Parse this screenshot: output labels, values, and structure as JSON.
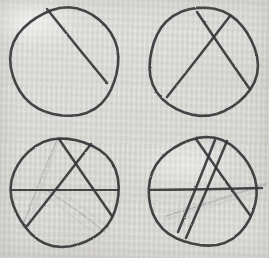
{
  "scene": {
    "title": "Hand-drawn pencil sketch: four circles with chords",
    "medium": "graphite pencil on textured paper",
    "layout": "2x2 grid of circles",
    "canvas": {
      "width": 269,
      "height": 258
    },
    "colors": {
      "paper": "#ececea",
      "paper_light": "#f3f2f0",
      "paper_shadow": "#e4e3df",
      "pencil_dark": "#37363a",
      "pencil_mid": "#55545a",
      "pencil_faint": "#9a9aa0",
      "pencil_ghost": "#b9b9bd"
    },
    "panels": [
      {
        "name": "top-left-circle",
        "index": 1,
        "circle": {
          "cx": 65,
          "cy": 62,
          "r": 54
        },
        "chord_count": 1,
        "faint_line_count": 0,
        "chords": [
          {
            "name": "chord-1",
            "x1": 47,
            "y1": 9,
            "x2": 107,
            "y2": 83,
            "weight": "dark"
          }
        ],
        "faint_lines": []
      },
      {
        "name": "top-right-circle",
        "index": 2,
        "circle": {
          "cx": 203,
          "cy": 62,
          "r": 54
        },
        "chord_count": 2,
        "faint_line_count": 0,
        "chords": [
          {
            "name": "chord-1",
            "x1": 197,
            "y1": 12,
            "x2": 249,
            "y2": 88,
            "weight": "dark"
          },
          {
            "name": "chord-2",
            "x1": 230,
            "y1": 16,
            "x2": 167,
            "y2": 97,
            "weight": "dark"
          }
        ],
        "faint_lines": []
      },
      {
        "name": "bottom-left-circle",
        "index": 3,
        "circle": {
          "cx": 65,
          "cy": 192,
          "r": 54
        },
        "chord_count": 3,
        "faint_line_count": 6,
        "chords": [
          {
            "name": "chord-1",
            "x1": 59,
            "y1": 139,
            "x2": 112,
            "y2": 216,
            "weight": "dark"
          },
          {
            "name": "chord-2",
            "x1": 91,
            "y1": 144,
            "x2": 27,
            "y2": 226,
            "weight": "dark"
          },
          {
            "name": "chord-3",
            "x1": 12,
            "y1": 190,
            "x2": 118,
            "y2": 190,
            "weight": "dark"
          }
        ],
        "faint_lines": [
          {
            "name": "ghost-1",
            "x1": 58,
            "y1": 137,
            "x2": 22,
            "y2": 228,
            "weight": "faint"
          },
          {
            "name": "ghost-2",
            "x1": 57,
            "y1": 138,
            "x2": 28,
            "y2": 224,
            "weight": "ghost"
          },
          {
            "name": "ghost-3",
            "x1": 59,
            "y1": 140,
            "x2": 33,
            "y2": 219,
            "weight": "ghost"
          },
          {
            "name": "ghost-4",
            "x1": 46,
            "y1": 190,
            "x2": 106,
            "y2": 233,
            "weight": "faint"
          },
          {
            "name": "ghost-5",
            "x1": 44,
            "y1": 192,
            "x2": 100,
            "y2": 236,
            "weight": "ghost"
          },
          {
            "name": "ghost-6",
            "x1": 50,
            "y1": 186,
            "x2": 109,
            "y2": 229,
            "weight": "ghost"
          }
        ]
      },
      {
        "name": "bottom-right-circle",
        "index": 4,
        "circle": {
          "cx": 203,
          "cy": 192,
          "r": 54
        },
        "chord_count": 4,
        "faint_line_count": 6,
        "chords": [
          {
            "name": "chord-1",
            "x1": 196,
            "y1": 139,
            "x2": 250,
            "y2": 215,
            "weight": "dark"
          },
          {
            "name": "chord-2",
            "x1": 227,
            "y1": 141,
            "x2": 186,
            "y2": 238,
            "weight": "dark"
          },
          {
            "name": "chord-3",
            "x1": 150,
            "y1": 190,
            "x2": 262,
            "y2": 188,
            "weight": "dark"
          },
          {
            "name": "chord-4",
            "x1": 215,
            "y1": 140,
            "x2": 178,
            "y2": 232,
            "weight": "dark"
          }
        ],
        "faint_lines": [
          {
            "name": "ghost-1",
            "x1": 166,
            "y1": 216,
            "x2": 266,
            "y2": 184,
            "weight": "faint"
          },
          {
            "name": "ghost-2",
            "x1": 164,
            "y1": 220,
            "x2": 262,
            "y2": 186,
            "weight": "ghost"
          },
          {
            "name": "ghost-3",
            "x1": 169,
            "y1": 212,
            "x2": 268,
            "y2": 182,
            "weight": "ghost"
          },
          {
            "name": "ghost-4",
            "x1": 163,
            "y1": 222,
            "x2": 257,
            "y2": 192,
            "weight": "ghost"
          },
          {
            "name": "ghost-5",
            "x1": 180,
            "y1": 230,
            "x2": 190,
            "y2": 200,
            "weight": "ghost"
          },
          {
            "name": "ghost-6",
            "x1": 172,
            "y1": 224,
            "x2": 240,
            "y2": 198,
            "weight": "ghost"
          }
        ]
      }
    ]
  }
}
